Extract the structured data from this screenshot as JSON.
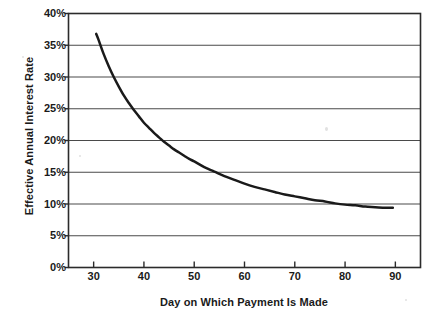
{
  "chart_data": {
    "type": "line",
    "title": "",
    "xlabel": "Day on Which Payment Is Made",
    "ylabel": "Effective Annual Interest Rate",
    "xlim": [
      25,
      95
    ],
    "ylim": [
      0,
      40
    ],
    "xticks": [
      30,
      40,
      50,
      60,
      70,
      80,
      90
    ],
    "xtick_labels": [
      "30",
      "40",
      "50",
      "60",
      "70",
      "80",
      "90"
    ],
    "yticks": [
      0,
      5,
      10,
      15,
      20,
      25,
      30,
      35,
      40
    ],
    "ytick_labels": [
      "0%",
      "5%",
      "10%",
      "15%",
      "20%",
      "25%",
      "30%",
      "35%",
      "40%"
    ],
    "grid": "horizontal",
    "legend": "none",
    "series": [
      {
        "name": "Effective Annual Interest Rate",
        "color": "#1a1a1a",
        "x": [
          30.5,
          31,
          32,
          33,
          34,
          35,
          36,
          37,
          38,
          39,
          40,
          41,
          42,
          43,
          44,
          45,
          46,
          47,
          48,
          49,
          50,
          52,
          54,
          56,
          58,
          60,
          62,
          64,
          66,
          68,
          70,
          72,
          74,
          76,
          78,
          80,
          82,
          84,
          86,
          88,
          89.5
        ],
        "y": [
          36.8,
          35.8,
          33.6,
          31.7,
          30.0,
          28.5,
          27.1,
          25.9,
          24.8,
          23.8,
          22.8,
          22.0,
          21.2,
          20.5,
          19.8,
          19.2,
          18.6,
          18.1,
          17.6,
          17.1,
          16.7,
          15.8,
          15.1,
          14.4,
          13.8,
          13.2,
          12.7,
          12.3,
          11.9,
          11.5,
          11.2,
          10.9,
          10.6,
          10.4,
          10.1,
          9.9,
          9.8,
          9.6,
          9.5,
          9.4,
          9.4
        ]
      }
    ],
    "notes": {
      "start_point": "Day 30.5, 36.8%",
      "end_point": "Day 89.5, 9.4%",
      "crossings": [
        "25% at day ~40",
        "20% at day ~49.5",
        "15% at day ~60",
        "10% at day ~79"
      ]
    }
  },
  "axis_titles": {
    "x": "Day on Which Payment Is Made",
    "y": "Effective Annual Interest Rate"
  },
  "colors": {
    "curve": "#1a1a1a",
    "frame": "#2b2b2b",
    "gridline": "#4a4a4a",
    "background": "#ffffff",
    "text": "#1a1a1a"
  }
}
